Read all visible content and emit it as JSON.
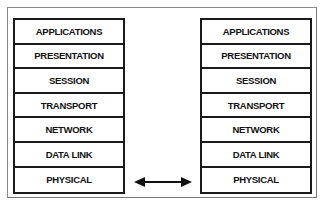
{
  "diagram": {
    "left_stack": {
      "layers": [
        "APPLICATIONS",
        "PRESENTATION",
        "SESSION",
        "TRANSPORT",
        "NETWORK",
        "DATA LINK",
        "PHYSICAL"
      ]
    },
    "right_stack": {
      "layers": [
        "APPLICATIONS",
        "PRESENTATION",
        "SESSION",
        "TRANSPORT",
        "NETWORK",
        "DATA LINK",
        "PHYSICAL"
      ]
    },
    "connector": {
      "type": "double-headed-arrow",
      "between": "PHYSICAL"
    }
  }
}
